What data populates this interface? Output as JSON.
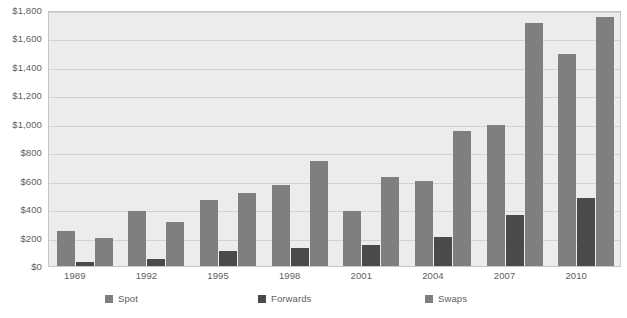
{
  "chart_data": {
    "type": "bar",
    "title": "",
    "subtitle": "",
    "xlabel": "",
    "ylabel": "",
    "grid": true,
    "legend_position": "bottom",
    "ylim": [
      0,
      1800
    ],
    "ytick_labels": [
      "$0",
      "$200",
      "$400",
      "$600",
      "$800",
      "$1,000",
      "$1,200",
      "$1,400",
      "$1,600",
      "$1,800"
    ],
    "ytick_values": [
      0,
      200,
      400,
      600,
      800,
      1000,
      1200,
      1400,
      1600,
      1800
    ],
    "categories": [
      "1989",
      "1992",
      "1995",
      "1998",
      "2001",
      "2004",
      "2007",
      "2010"
    ],
    "series": [
      {
        "name": "Spot",
        "color": "#7f7f7f",
        "values": [
          245,
          385,
          465,
          570,
          385,
          600,
          995,
          1490
        ]
      },
      {
        "name": "Forwards",
        "color": "#4a4a4a",
        "values": [
          30,
          50,
          105,
          130,
          145,
          205,
          360,
          480
        ]
      },
      {
        "name": "Swaps",
        "color": "#7f7f7f",
        "values": [
          195,
          310,
          510,
          735,
          625,
          950,
          1710,
          1750
        ]
      }
    ]
  },
  "legend": {
    "items": [
      {
        "label": "Spot",
        "swatch_color": "#7f7f7f"
      },
      {
        "label": "Forwards",
        "swatch_color": "#4a4a4a"
      },
      {
        "label": "Swaps",
        "swatch_color": "#7f7f7f"
      }
    ]
  },
  "colors": {
    "plot_background": "#ececed",
    "gridline": "#d2d2d3",
    "plot_border": "#c6c6c6",
    "text": "#5e5e5e"
  }
}
